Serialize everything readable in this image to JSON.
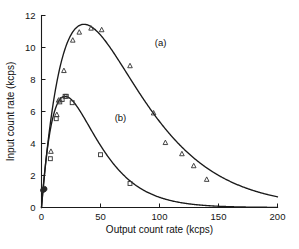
{
  "chart_data": {
    "type": "scatter",
    "title": "",
    "xlabel": "Output count rate (kcps)",
    "ylabel": "Input count rate (kcps)",
    "xlim": [
      0,
      200
    ],
    "ylim": [
      0,
      12
    ],
    "xticks": [
      0,
      50,
      100,
      150,
      200
    ],
    "yticks": [
      0,
      2,
      4,
      6,
      8,
      10,
      12
    ],
    "xtick_labels": [
      "0",
      "50",
      "100",
      "150",
      "200"
    ],
    "ytick_labels": [
      "0",
      "2",
      "4",
      "6",
      "8",
      "10",
      "12"
    ],
    "grid": false,
    "legend_position": "inline-annotation",
    "annotations": [
      {
        "text": "(a)",
        "x": 96,
        "y": 10.1
      },
      {
        "text": "(b)",
        "x": 62,
        "y": 5.4
      }
    ],
    "series": [
      {
        "name": "(a)",
        "marker": "triangle-up",
        "points": [
          {
            "x": 1.0,
            "y": 1.1
          },
          {
            "x": 2.0,
            "y": 1.1
          },
          {
            "x": 2.5,
            "y": 1.2
          },
          {
            "x": 8.0,
            "y": 3.5
          },
          {
            "x": 13.0,
            "y": 5.8
          },
          {
            "x": 14.5,
            "y": 6.7
          },
          {
            "x": 19.0,
            "y": 8.55
          },
          {
            "x": 26.5,
            "y": 10.45
          },
          {
            "x": 32.0,
            "y": 10.95
          },
          {
            "x": 42.0,
            "y": 11.2
          },
          {
            "x": 51.0,
            "y": 11.1
          },
          {
            "x": 75.0,
            "y": 8.85
          },
          {
            "x": 95.0,
            "y": 5.9
          },
          {
            "x": 105.0,
            "y": 4.05
          },
          {
            "x": 119.0,
            "y": 3.35
          },
          {
            "x": 129.0,
            "y": 2.6
          },
          {
            "x": 140.0,
            "y": 1.75
          }
        ],
        "fit_curve": {
          "description": "paralyzable dead-time response, peak near 11.45 kcps at 36 kcps output",
          "peak_x": 36,
          "peak_y": 11.45
        }
      },
      {
        "name": "(b)",
        "marker": "square",
        "points": [
          {
            "x": 1.0,
            "y": 1.05
          },
          {
            "x": 2.0,
            "y": 1.1
          },
          {
            "x": 3.0,
            "y": 1.15
          },
          {
            "x": 7.5,
            "y": 3.05
          },
          {
            "x": 12.5,
            "y": 5.55
          },
          {
            "x": 15.5,
            "y": 6.6
          },
          {
            "x": 17.5,
            "y": 6.75
          },
          {
            "x": 20.0,
            "y": 6.95
          },
          {
            "x": 21.0,
            "y": 6.95
          },
          {
            "x": 26.0,
            "y": 6.55
          },
          {
            "x": 50.0,
            "y": 3.3
          },
          {
            "x": 75.0,
            "y": 1.5
          }
        ],
        "fit_curve": {
          "description": "paralyzable dead-time response, peak near 6.95 kcps at 20 kcps output",
          "peak_x": 20,
          "peak_y": 6.95
        }
      }
    ]
  }
}
